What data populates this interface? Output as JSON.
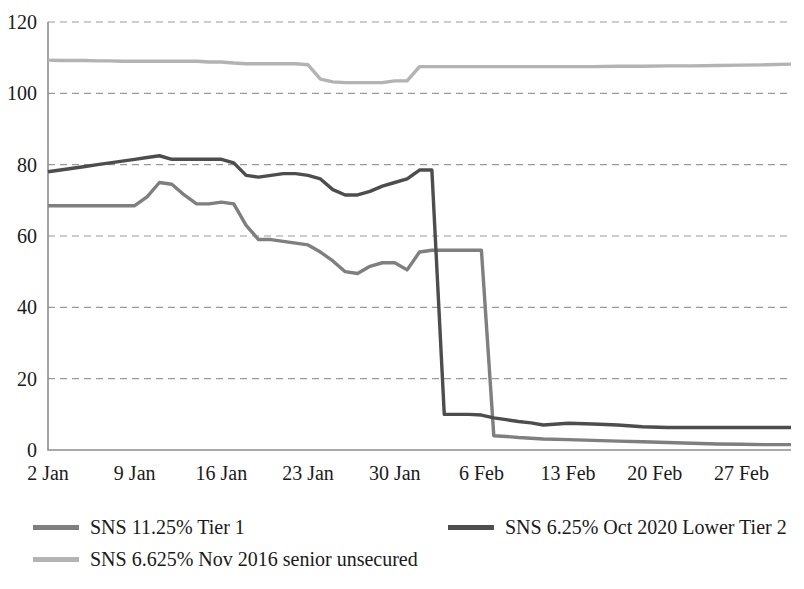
{
  "chart_data": {
    "type": "line",
    "title": "",
    "subtitle": "",
    "xlabel": "",
    "ylabel": "",
    "ylim": [
      0,
      120
    ],
    "yticks": [
      0,
      20,
      40,
      60,
      80,
      100,
      120
    ],
    "xticks": [
      "2 Jan",
      "9 Jan",
      "16 Jan",
      "23 Jan",
      "30 Jan",
      "6 Feb",
      "13 Feb",
      "20 Feb",
      "27 Feb"
    ],
    "xtick_positions": [
      0,
      7,
      14,
      21,
      28,
      35,
      42,
      49,
      56
    ],
    "xlim": [
      0,
      60
    ],
    "grid": "horizontal-dashed",
    "legend_position": "bottom-left",
    "series": [
      {
        "name": "SNS 11.25% Tier 1",
        "color": "#7f7f7f",
        "x": [
          0,
          1,
          2,
          3,
          4,
          5,
          6,
          7,
          8,
          9,
          10,
          11,
          12,
          13,
          14,
          15,
          16,
          17,
          18,
          19,
          20,
          21,
          22,
          23,
          24,
          25,
          26,
          27,
          28,
          29,
          30,
          31,
          32,
          33,
          34,
          35,
          36,
          37,
          38,
          39,
          40,
          42,
          44,
          46,
          48,
          50,
          52,
          54,
          56,
          58,
          60
        ],
        "values": [
          68.5,
          68.5,
          68.5,
          68.5,
          68.5,
          68.5,
          68.5,
          68.5,
          71.0,
          75.0,
          74.5,
          71.5,
          69.0,
          69.0,
          69.5,
          69.0,
          63.0,
          59.0,
          59.0,
          58.5,
          58.0,
          57.5,
          55.5,
          53.0,
          50.0,
          49.5,
          51.5,
          52.5,
          52.5,
          50.5,
          55.5,
          56.0,
          56.0,
          56.0,
          56.0,
          56.0,
          4.0,
          3.8,
          3.5,
          3.3,
          3.1,
          2.9,
          2.7,
          2.5,
          2.3,
          2.1,
          1.9,
          1.7,
          1.6,
          1.5,
          1.5
        ]
      },
      {
        "name": "SNS 6.25% Oct 2020 Lower Tier 2",
        "color": "#4d4d4d",
        "x": [
          0,
          1,
          2,
          3,
          4,
          5,
          6,
          7,
          8,
          9,
          10,
          11,
          12,
          13,
          14,
          15,
          16,
          17,
          18,
          19,
          20,
          21,
          22,
          23,
          24,
          25,
          26,
          27,
          28,
          29,
          30,
          31,
          32,
          33,
          34,
          35,
          36,
          37,
          38,
          39,
          40,
          42,
          44,
          46,
          48,
          50,
          52,
          54,
          56,
          58,
          60
        ],
        "values": [
          78.0,
          78.5,
          79.0,
          79.5,
          80.0,
          80.5,
          81.0,
          81.5,
          82.0,
          82.5,
          81.5,
          81.5,
          81.5,
          81.5,
          81.5,
          80.5,
          77.0,
          76.5,
          77.0,
          77.5,
          77.5,
          77.0,
          76.0,
          73.0,
          71.5,
          71.5,
          72.5,
          74.0,
          75.0,
          76.0,
          78.5,
          78.5,
          10.0,
          10.0,
          10.0,
          9.8,
          9.0,
          8.5,
          8.0,
          7.6,
          7.0,
          7.5,
          7.3,
          7.0,
          6.5,
          6.3,
          6.3,
          6.3,
          6.3,
          6.3,
          6.3
        ]
      },
      {
        "name": "SNS 6.625% Nov 2016 senior unsecured",
        "color": "#b3b3b3",
        "x": [
          0,
          1,
          2,
          3,
          4,
          5,
          6,
          7,
          8,
          9,
          10,
          11,
          12,
          13,
          14,
          15,
          16,
          17,
          18,
          19,
          20,
          21,
          22,
          23,
          24,
          25,
          26,
          27,
          28,
          29,
          30,
          32,
          34,
          36,
          38,
          40,
          42,
          44,
          46,
          48,
          50,
          52,
          54,
          56,
          58,
          60
        ],
        "values": [
          109.3,
          109.2,
          109.2,
          109.2,
          109.1,
          109.1,
          109.0,
          109.0,
          109.0,
          109.0,
          109.0,
          109.0,
          109.0,
          108.8,
          108.8,
          108.5,
          108.3,
          108.3,
          108.3,
          108.3,
          108.3,
          108.0,
          104.0,
          103.2,
          103.0,
          103.0,
          103.0,
          103.0,
          103.5,
          103.5,
          107.5,
          107.5,
          107.5,
          107.5,
          107.5,
          107.5,
          107.5,
          107.5,
          107.6,
          107.6,
          107.7,
          107.7,
          107.8,
          107.9,
          108.0,
          108.2
        ]
      }
    ]
  },
  "legend": {
    "items": [
      {
        "label": "SNS 11.25% Tier 1",
        "color": "#7f7f7f"
      },
      {
        "label": "SNS 6.25% Oct 2020 Lower Tier 2",
        "color": "#4d4d4d"
      },
      {
        "label": "SNS 6.625% Nov 2016 senior unsecured",
        "color": "#b3b3b3"
      }
    ]
  }
}
